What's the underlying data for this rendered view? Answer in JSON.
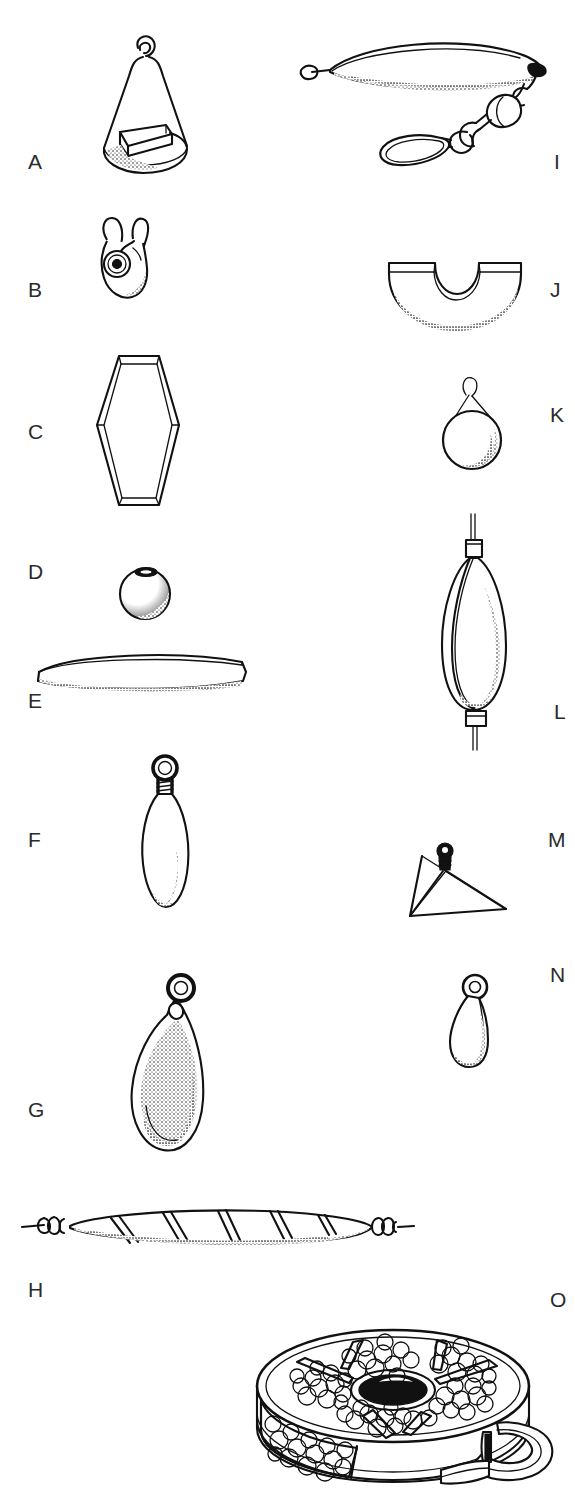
{
  "plate": {
    "title": "Fishing sinker and weight types",
    "description": "Black-and-white line drawing plate of fifteen fishing sinkers, weights and accessories, each keyed with a letter.",
    "background_color": "#ffffff",
    "ink_color": "#111111",
    "label_color": "#2b2b2b",
    "width": 575,
    "height": 1490
  },
  "figures": [
    {
      "key": "A",
      "label": "A",
      "name": "cone-sinker-with-flat-base-fin",
      "column": "left",
      "label_x": 28,
      "label_y": 151
    },
    {
      "key": "B",
      "label": "B",
      "name": "split-shot-pinch-on-sinker",
      "column": "left",
      "label_x": 28,
      "label_y": 279
    },
    {
      "key": "C",
      "label": "C",
      "name": "hexagonal-flat-sinker",
      "column": "left",
      "label_x": 28,
      "label_y": 421
    },
    {
      "key": "D",
      "label": "D",
      "name": "round-ball-bullet-sinker",
      "column": "left",
      "label_x": 28,
      "label_y": 561
    },
    {
      "key": "E",
      "label": "E",
      "name": "flat-lens-disc-sinker",
      "column": "left",
      "label_x": 28,
      "label_y": 690
    },
    {
      "key": "F",
      "label": "F",
      "name": "slim-torpedo-sinker-with-wire-eye",
      "column": "left",
      "label_x": 28,
      "label_y": 829
    },
    {
      "key": "G",
      "label": "G",
      "name": "teardrop-bank-sinker-with-eye",
      "column": "left",
      "label_x": 28,
      "label_y": 1099
    },
    {
      "key": "H",
      "label": "H",
      "name": "spiral-grooved-twist-on-sinker",
      "column": "left",
      "label_x": 28,
      "label_y": 1279
    },
    {
      "key": "I",
      "label": "I",
      "name": "trolling-keel-sinker-with-swivel-and-snap",
      "column": "right",
      "label_x": 554,
      "label_y": 151
    },
    {
      "key": "J",
      "label": "J",
      "name": "half-moon-notched-sinker",
      "column": "right",
      "label_x": 550,
      "label_y": 279
    },
    {
      "key": "K",
      "label": "K",
      "name": "round-ball-sinker-on-wire-loop",
      "column": "right",
      "label_x": 550,
      "label_y": 404
    },
    {
      "key": "L",
      "label": "L",
      "name": "in-line-egg-sinker-on-line",
      "column": "right",
      "label_x": 554,
      "label_y": 701
    },
    {
      "key": "M",
      "label": "M",
      "name": "pyramid-sinker-with-swivel-eye",
      "column": "right",
      "label_x": 548,
      "label_y": 829
    },
    {
      "key": "N",
      "label": "N",
      "name": "small-teardrop-dipsey-sinker",
      "column": "right",
      "label_x": 550,
      "label_y": 964
    },
    {
      "key": "O",
      "label": "O",
      "name": "compartment-split-shot-dispenser-box",
      "column": "right",
      "label_x": 550,
      "label_y": 1289
    }
  ]
}
